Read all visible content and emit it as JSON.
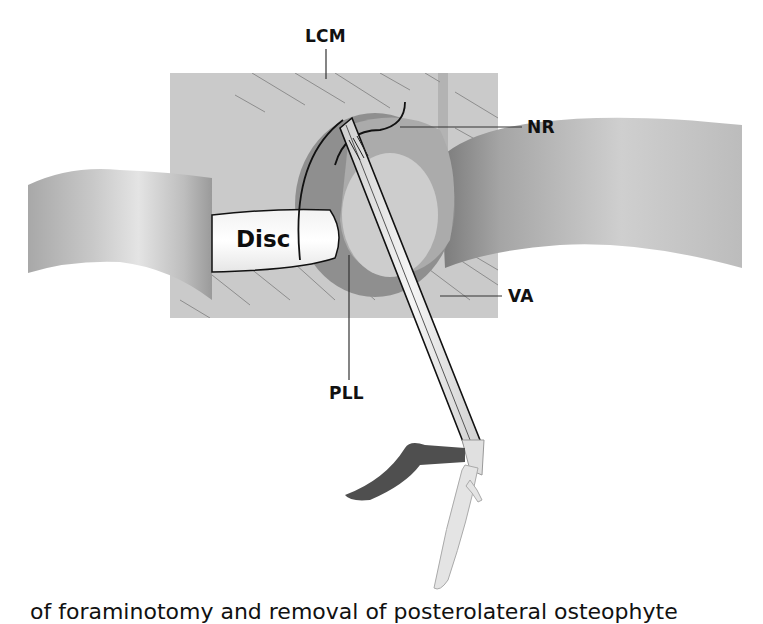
{
  "figure": {
    "kind": "anatomical-illustration",
    "style": "grayscale",
    "labels": {
      "lcm": "LCM",
      "nr": "NR",
      "va": "VA",
      "pll": "PLL",
      "disc": "Disc"
    },
    "caption_partial": "of foraminotomy and removal of posterolateral osteophyte"
  },
  "colors": {
    "background": "#ffffff",
    "bone_block": "#c9c9c9",
    "ring_dark": "#8c8c8c",
    "ring_light": "#bdbdbd",
    "nerve_root": "#b5b5b5",
    "instrument": "#e6e6e6",
    "handle_dark": "#555555",
    "line": "#111111"
  }
}
